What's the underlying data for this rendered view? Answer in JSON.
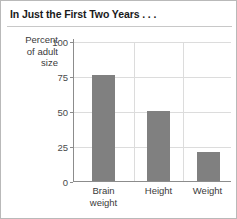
{
  "title": "In Just the First Two Years . . .",
  "axis": {
    "ylabel_lines": [
      "Percent",
      "of adult",
      "size"
    ],
    "yticks": [
      "100",
      "75",
      "50",
      "25",
      "0"
    ]
  },
  "categories": [
    {
      "lines": [
        "Brain",
        "weight"
      ]
    },
    {
      "lines": [
        "Height"
      ]
    },
    {
      "lines": [
        "Weight"
      ]
    }
  ],
  "colors": {
    "bar": "#808080",
    "grid": "#dcdcdc",
    "axis": "#8c8c8c",
    "border": "#b9b9b9",
    "text": "#3a3a3a"
  },
  "chart_data": {
    "type": "bar",
    "title": "In Just the First Two Years . . .",
    "xlabel": "",
    "ylabel": "Percent of adult size",
    "categories": [
      "Brain weight",
      "Height",
      "Weight"
    ],
    "values": [
      76,
      50,
      21
    ],
    "ylim": [
      0,
      100
    ],
    "yticks": [
      0,
      25,
      50,
      75,
      100
    ],
    "grid": true,
    "legend": false
  }
}
